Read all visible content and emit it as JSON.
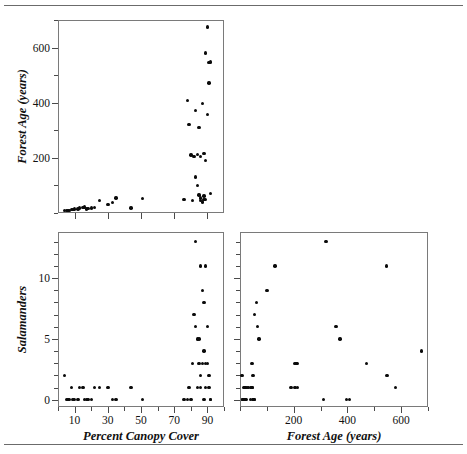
{
  "figure": {
    "kind": "scatterplot-matrix",
    "rule_color": "#6b6b6b",
    "point_color": "#0a0a0a",
    "background": "#ffffff"
  },
  "chart_data": [
    {
      "type": "scatter",
      "panel": "top-left",
      "title": "",
      "xlabel": "",
      "ylabel": "Forest Age (years)",
      "xlim": [
        0,
        100
      ],
      "ylim": [
        0,
        700
      ],
      "xticks": [
        10,
        30,
        50,
        70,
        90
      ],
      "xticklabels": [
        "",
        "",
        "",
        "",
        ""
      ],
      "yticks": [
        200,
        400,
        600
      ],
      "yticklabels": [
        "200",
        "400",
        "600"
      ],
      "yminorticks": [
        0,
        100,
        300,
        500,
        700
      ],
      "grid": false,
      "legend": null,
      "x": [
        4,
        5,
        6,
        7,
        8,
        9,
        10,
        12,
        13,
        15,
        16,
        17,
        18,
        20,
        22,
        25,
        30,
        33,
        35,
        44,
        51,
        76,
        78,
        79,
        80,
        81,
        82,
        83,
        83,
        84,
        84,
        85,
        85,
        86,
        86,
        86,
        87,
        87,
        88,
        88,
        88,
        89,
        89,
        89,
        90,
        90,
        91,
        91,
        92,
        92
      ],
      "y": [
        8,
        9,
        10,
        10,
        12,
        12,
        14,
        15,
        18,
        20,
        22,
        14,
        16,
        18,
        20,
        45,
        30,
        38,
        55,
        18,
        52,
        48,
        408,
        320,
        210,
        45,
        205,
        372,
        130,
        100,
        212,
        310,
        65,
        55,
        205,
        45,
        397,
        40,
        215,
        48,
        62,
        580,
        190,
        50,
        675,
        358,
        545,
        472,
        548,
        70
      ]
    },
    {
      "type": "scatter",
      "panel": "bottom-left",
      "title": "",
      "xlabel": "Percent Canopy Cover",
      "ylabel": "Salamanders",
      "xlim": [
        0,
        100
      ],
      "ylim": [
        -0.6,
        13.8
      ],
      "xticks": [
        10,
        30,
        50,
        70,
        90
      ],
      "xticklabels": [
        "10",
        "30",
        "50",
        "70",
        "90"
      ],
      "xminorticks": [
        0,
        20,
        40,
        60,
        80,
        100
      ],
      "yticks": [
        0,
        5,
        10
      ],
      "yticklabels": [
        "0",
        "5",
        "10"
      ],
      "yminorticks": [
        1,
        2,
        3,
        4,
        6,
        7,
        8,
        9,
        11,
        12,
        13
      ],
      "grid": false,
      "legend": null,
      "x": [
        4,
        5,
        6,
        7,
        8,
        9,
        10,
        12,
        13,
        15,
        16,
        17,
        18,
        20,
        22,
        25,
        30,
        33,
        35,
        44,
        51,
        76,
        78,
        79,
        80,
        81,
        82,
        83,
        83,
        84,
        84,
        85,
        85,
        86,
        86,
        86,
        87,
        87,
        88,
        88,
        88,
        89,
        89,
        89,
        90,
        90,
        91,
        91,
        92,
        92
      ],
      "y": [
        2,
        0,
        0,
        0,
        1,
        0,
        0,
        0,
        1,
        1,
        0,
        0,
        0,
        0,
        1,
        1,
        1,
        0,
        0,
        1,
        0,
        0,
        0,
        1,
        0,
        3,
        7,
        6,
        13,
        1,
        5,
        3,
        5,
        2,
        11,
        1,
        9,
        3,
        8,
        4,
        0,
        11,
        3,
        1,
        6,
        3,
        2,
        1,
        0,
        0
      ]
    },
    {
      "type": "scatter",
      "panel": "bottom-right",
      "title": "",
      "xlabel": "Forest Age (years)",
      "ylabel": "",
      "xlim": [
        0,
        700
      ],
      "ylim": [
        -0.6,
        13.8
      ],
      "xticks": [
        200,
        400,
        600
      ],
      "xticklabels": [
        "200",
        "400",
        "600"
      ],
      "xminorticks": [
        0,
        100,
        300,
        500,
        700
      ],
      "yticks": [
        0,
        5,
        10
      ],
      "yticklabels": [
        "",
        "",
        ""
      ],
      "yminorticks": [
        1,
        2,
        3,
        4,
        6,
        7,
        8,
        9,
        11,
        12,
        13
      ],
      "grid": false,
      "legend": null,
      "x": [
        8,
        9,
        10,
        10,
        12,
        12,
        14,
        15,
        18,
        20,
        22,
        14,
        16,
        18,
        20,
        45,
        30,
        38,
        55,
        18,
        52,
        48,
        408,
        320,
        210,
        45,
        205,
        372,
        130,
        100,
        212,
        310,
        65,
        55,
        205,
        45,
        397,
        40,
        215,
        48,
        62,
        580,
        190,
        50,
        675,
        358,
        545,
        472,
        548,
        70
      ],
      "y": [
        2,
        0,
        0,
        0,
        1,
        0,
        0,
        0,
        1,
        1,
        0,
        0,
        0,
        0,
        1,
        1,
        1,
        0,
        0,
        1,
        0,
        0,
        0,
        13,
        3,
        3,
        3,
        5,
        11,
        9,
        3,
        0,
        6,
        7,
        1,
        1,
        0,
        1,
        1,
        2,
        8,
        1,
        1,
        0,
        4,
        6,
        11,
        3,
        2,
        5
      ]
    }
  ],
  "labels": {
    "y_top_left": "Forest Age (years)",
    "y_bottom_left": "Salamanders",
    "x_bottom_left": "Percent Canopy Cover",
    "x_bottom_right": "Forest Age (years)"
  }
}
